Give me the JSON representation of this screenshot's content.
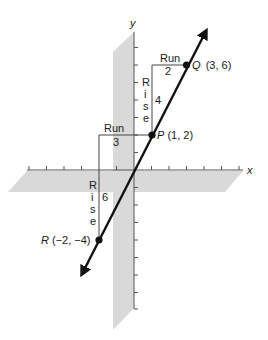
{
  "diagram": {
    "type": "coordinate-plane-slope",
    "axes": {
      "x_label": "x",
      "y_label": "y"
    },
    "line": {
      "description": "Line through P, Q and R with arrows at both ends",
      "slope": 2
    },
    "points": [
      {
        "name": "Q",
        "coords": "(3, 6)",
        "x": 3,
        "y": 6
      },
      {
        "name": "P",
        "coords": "(1, 2)",
        "x": 1,
        "y": 2
      },
      {
        "name": "R",
        "coords": "(−2, −4)",
        "x": -2,
        "y": -4
      }
    ],
    "triangles": [
      {
        "run_label": "Run",
        "run_value": "2",
        "rise_label": [
          "R",
          "i",
          "s",
          "e"
        ],
        "rise_value": "4"
      },
      {
        "run_label": "Run",
        "run_value": "3",
        "rise_label": [
          "R",
          "i",
          "s",
          "e"
        ],
        "rise_value": "6"
      }
    ],
    "colors": {
      "plane": "#d9d9d9",
      "line": "#111111",
      "axis": "#555555",
      "guide": "#444444"
    }
  }
}
